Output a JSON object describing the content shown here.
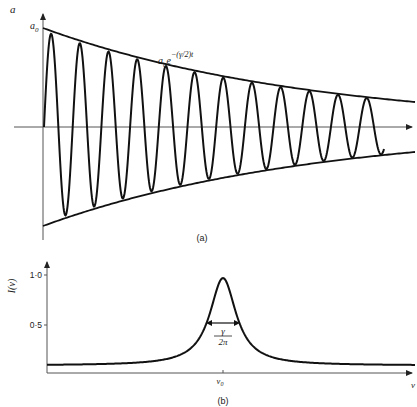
{
  "figure": {
    "panel_a": {
      "caption": "(a)",
      "y_axis_label": "a",
      "y_intercept_label": "a",
      "y_intercept_subscript": "0",
      "envelope_label_base": "a",
      "envelope_label_subscript": "0",
      "envelope_label_e": "e",
      "envelope_label_exponent": "−(γ/2)t",
      "description": "Damped oscillation with exponentially decaying envelope",
      "num_oscillations": 12
    },
    "panel_b": {
      "caption": "(b)",
      "y_axis_label": "I(ν)",
      "y_ticks": [
        "1·0",
        "0·5"
      ],
      "x_axis_label": "ν",
      "center_label": "ν",
      "center_subscript": "0",
      "width_label_numerator": "γ",
      "width_label_denominator": "2π",
      "description": "Lorentzian line shape centered at ν0 with FWHM γ/2π"
    }
  },
  "chart_data": [
    {
      "type": "line",
      "title": "(a) Damped oscillation",
      "xlabel": "t",
      "ylabel": "a",
      "annotations": [
        "a0",
        "a0 e^−(γ/2)t"
      ],
      "series": [
        {
          "name": "upper envelope",
          "formula": "a0 e^-(γ/2)t"
        },
        {
          "name": "lower envelope",
          "formula": "-a0 e^-(γ/2)t"
        },
        {
          "name": "oscillation",
          "formula": "a0 e^-(γ/2)t cos(2πν0 t)",
          "cycles": 12
        }
      ],
      "grid": false
    },
    {
      "type": "line",
      "title": "(b) Line shape",
      "xlabel": "ν",
      "ylabel": "I(ν)",
      "y_ticks": [
        0.5,
        1.0
      ],
      "ylim": [
        0,
        1.05
      ],
      "annotations": [
        "ν0",
        "γ/2π"
      ],
      "series": [
        {
          "name": "Lorentzian",
          "peak_x": "ν0",
          "peak_y": 1.0,
          "fwhm": "γ/2π",
          "baseline": 0.08
        }
      ],
      "grid": false
    }
  ]
}
